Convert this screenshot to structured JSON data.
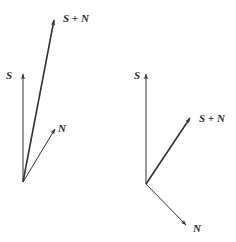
{
  "diagrams": [
    {
      "name": "in-phase-addition",
      "origin": [
        23,
        182
      ],
      "vectors": [
        {
          "id": "S",
          "label": "S",
          "tip": [
            23,
            74
          ],
          "width": 1.0,
          "label_pos": [
            6,
            70
          ]
        },
        {
          "id": "N",
          "label": "N",
          "tip": [
            55,
            129
          ],
          "width": 1.0,
          "label_pos": [
            58,
            123
          ]
        },
        {
          "id": "SN",
          "label": "S + N",
          "tip": [
            54,
            20
          ],
          "width": 1.6,
          "label_pos": [
            63,
            13
          ]
        }
      ]
    },
    {
      "name": "quadrature-addition",
      "origin": [
        146,
        184
      ],
      "vectors": [
        {
          "id": "S",
          "label": "S",
          "tip": [
            146,
            74
          ],
          "width": 1.0,
          "label_pos": [
            134,
            70
          ]
        },
        {
          "id": "N",
          "label": "N",
          "tip": [
            186,
            225
          ],
          "width": 1.0,
          "label_pos": [
            193,
            223
          ]
        },
        {
          "id": "SN",
          "label": "S + N",
          "tip": [
            190,
            118
          ],
          "width": 1.6,
          "label_pos": [
            199,
            113
          ]
        }
      ]
    }
  ],
  "colors": {
    "line": "#333333",
    "text": "#2a2a2a",
    "background": "#ffffff"
  }
}
